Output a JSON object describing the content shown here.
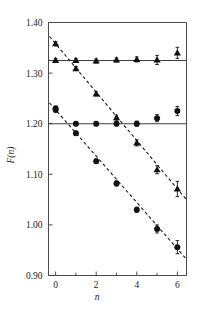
{
  "chart_data": {
    "type": "scatter",
    "title": "",
    "xlabel": "n",
    "ylabel": "F(n)",
    "xlim": [
      -0.35,
      6.45
    ],
    "ylim": [
      0.9,
      1.4
    ],
    "grid": false,
    "legend_position": "none",
    "x_ticks_major": [
      0,
      2,
      4,
      6
    ],
    "x_ticks_minor": [
      1,
      3,
      5
    ],
    "x_tick_labels": [
      "0",
      "2",
      "4",
      "6"
    ],
    "y_ticks_major": [
      0.9,
      1.0,
      1.1,
      1.2,
      1.3,
      1.4
    ],
    "y_tick_labels": [
      "0.90",
      "1.00",
      "1.10",
      "1.20",
      "1.30",
      "1.40"
    ],
    "x": [
      0,
      1,
      2,
      3,
      4,
      5,
      6
    ],
    "series": [
      {
        "name": "flat-triangles",
        "marker": "triangle",
        "fit": "solid",
        "fit_type": "horizontal",
        "fit_value": 1.325,
        "values": [
          1.325,
          1.325,
          1.324,
          1.326,
          1.327,
          1.326,
          1.34
        ],
        "errors": [
          0.004,
          0.004,
          0.004,
          0.004,
          0.005,
          0.009,
          0.011
        ]
      },
      {
        "name": "descending-triangles",
        "marker": "triangle",
        "fit": "dashed",
        "fit_type": "linear",
        "fit_intercept": 1.358,
        "fit_slope": -0.0478,
        "values": [
          1.358,
          1.309,
          1.259,
          1.212,
          1.162,
          1.109,
          1.071
        ],
        "errors": [
          0.004,
          0.004,
          0.004,
          0.005,
          0.006,
          0.008,
          0.015
        ]
      },
      {
        "name": "flat-circles",
        "marker": "circle",
        "fit": "solid",
        "fit_type": "horizontal",
        "fit_value": 1.2,
        "values": [
          1.23,
          1.2,
          1.2,
          1.2,
          1.2,
          1.211,
          1.225
        ],
        "errors": [
          0.005,
          0.004,
          0.004,
          0.004,
          0.005,
          0.007,
          0.009
        ]
      },
      {
        "name": "descending-circles",
        "marker": "circle",
        "fit": "dashed",
        "fit_type": "linear",
        "fit_intercept": 1.2275,
        "fit_slope": -0.0458,
        "values": [
          1.2275,
          1.181,
          1.126,
          1.082,
          1.03,
          0.992,
          0.956
        ],
        "errors": [
          0.005,
          0.004,
          0.004,
          0.005,
          0.005,
          0.008,
          0.013
        ]
      }
    ]
  },
  "axes": {
    "y_label": "F(n)",
    "x_label": "n",
    "y_tick_0": "0.90",
    "y_tick_1": "1.00",
    "y_tick_2": "1.10",
    "y_tick_3": "1.20",
    "y_tick_4": "1.30",
    "y_tick_5": "1.40",
    "x_tick_0": "0",
    "x_tick_1": "2",
    "x_tick_2": "4",
    "x_tick_3": "6"
  },
  "colors": {
    "marker": "#111111",
    "axis": "#4a4a4a",
    "fit_line": "#1a1a1a",
    "background": "#ffffff"
  }
}
